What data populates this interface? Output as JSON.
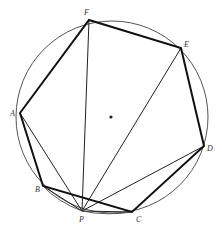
{
  "diagram": {
    "type": "inscribed-polygon",
    "circle": {
      "cx": 112,
      "cy": 117,
      "r": 96,
      "stroke": "#555555"
    },
    "center_dot": {
      "x": 111,
      "y": 117
    },
    "points": {
      "F": {
        "x": 89,
        "y": 20,
        "label": "F",
        "lx": 84,
        "ly": 15
      },
      "E": {
        "x": 181,
        "y": 48,
        "label": "E",
        "lx": 184,
        "ly": 47
      },
      "A": {
        "x": 20,
        "y": 113,
        "label": "A",
        "lx": 10,
        "ly": 116
      },
      "D": {
        "x": 204,
        "y": 146,
        "label": "D",
        "lx": 207,
        "ly": 151
      },
      "B": {
        "x": 43,
        "y": 186,
        "label": "B",
        "lx": 35,
        "ly": 192
      },
      "P": {
        "x": 82,
        "y": 211,
        "label": "P",
        "lx": 79,
        "ly": 222
      },
      "C": {
        "x": 132,
        "y": 212,
        "label": "C",
        "lx": 136,
        "ly": 222
      }
    },
    "polygon_order": [
      "A",
      "F",
      "E",
      "D",
      "C",
      "B",
      "A"
    ],
    "thin_lines_from_P": [
      "A",
      "F",
      "E",
      "D",
      "C",
      "B"
    ],
    "labels": [
      "A",
      "B",
      "C",
      "D",
      "E",
      "F",
      "P"
    ]
  }
}
